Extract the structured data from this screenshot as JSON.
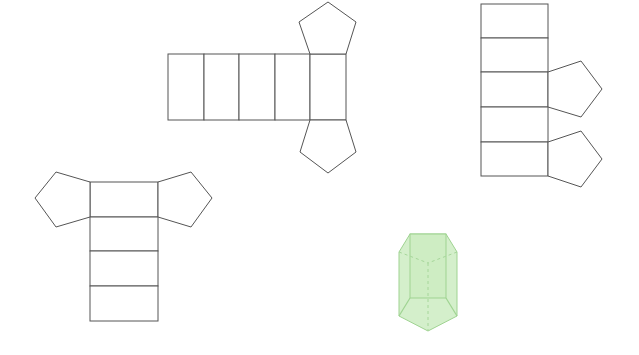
{
  "figures": [
    {
      "id": "net-a",
      "description": "pentagonal prism net: five horizontal rectangles with pentagons above and below the last rectangle"
    },
    {
      "id": "net-b",
      "description": "five vertically stacked rectangles with two pentagons attached on the right"
    },
    {
      "id": "net-c",
      "description": "four vertically stacked rectangles with pentagons left and right of the top rectangle"
    },
    {
      "id": "prism",
      "description": "green translucent pentagonal prism with dashed hidden edges"
    }
  ],
  "colors": {
    "line": "#555555",
    "prism_fill": "#cdecc2",
    "prism_edge": "#9fd391"
  }
}
